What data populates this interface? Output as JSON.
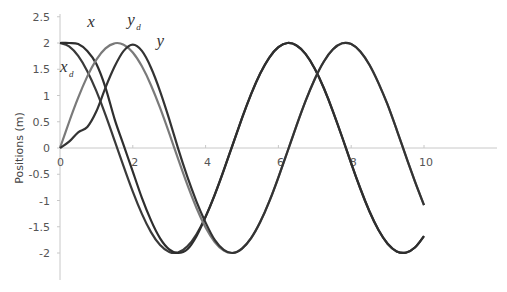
{
  "chart_data": {
    "type": "line",
    "title": "",
    "xlabel": "",
    "ylabel": "Positions (m)",
    "xlim": [
      0,
      12
    ],
    "ylim": [
      -2.5,
      2.5
    ],
    "x_ticks": [
      0,
      2,
      4,
      6,
      8,
      10
    ],
    "y_ticks": [
      2.5,
      2,
      1.5,
      1,
      0.5,
      0,
      -0.5,
      -1,
      -1.5,
      -2
    ],
    "y_tick_labels": [
      "2.5",
      "2",
      "1.5",
      "1",
      "0.5",
      "0",
      "-0.5",
      "-1",
      "-1.5",
      "-2"
    ],
    "x_tick_labels": [
      "0",
      "2",
      "4",
      "6",
      "8",
      "10"
    ],
    "grid": false,
    "legend": "inline labels",
    "x": [
      0,
      0.25,
      0.5,
      0.75,
      1,
      1.25,
      1.5,
      1.75,
      2,
      2.25,
      2.5,
      2.75,
      3,
      3.25,
      3.5,
      3.75,
      4,
      4.25,
      4.5,
      4.75,
      5,
      5.25,
      5.5,
      5.75,
      6,
      6.25,
      6.5,
      6.75,
      7,
      7.25,
      7.5,
      7.75,
      8,
      8.25,
      8.5,
      8.75,
      9,
      9.25,
      9.5,
      9.75,
      10
    ],
    "series": [
      {
        "name": "x_d",
        "label": "x",
        "subscript": "d",
        "color": "#3a3a3a",
        "values": [
          2,
          1.938,
          1.755,
          1.463,
          1.081,
          0.631,
          0.141,
          -0.356,
          -0.832,
          -1.256,
          -1.602,
          -1.849,
          -1.98,
          -1.988,
          -1.873,
          -1.641,
          -1.307,
          -0.892,
          -0.421,
          0.075,
          0.567,
          1.024,
          1.417,
          1.722,
          1.92,
          2.0,
          1.953,
          1.787,
          1.508,
          1.137,
          0.694,
          0.209,
          -0.291,
          -0.772,
          -1.205,
          -1.562,
          -1.822,
          -1.969,
          -1.994,
          -1.896,
          -1.678
        ]
      },
      {
        "name": "x",
        "label": "x",
        "subscript": "",
        "color": "#2e2e2e",
        "values": [
          2,
          2,
          1.98,
          1.85,
          1.6,
          1.15,
          0.55,
          0.05,
          -0.45,
          -0.95,
          -1.38,
          -1.72,
          -1.93,
          -2.0,
          -1.93,
          -1.68,
          -1.31,
          -0.892,
          -0.421,
          0.075,
          0.567,
          1.024,
          1.417,
          1.722,
          1.92,
          2.0,
          1.953,
          1.787,
          1.508,
          1.137,
          0.694,
          0.209,
          -0.291,
          -0.772,
          -1.205,
          -1.562,
          -1.822,
          -1.969,
          -1.994,
          -1.896,
          -1.678
        ]
      },
      {
        "name": "y_d",
        "label": "y",
        "subscript": "d",
        "color": "#7a7a7a",
        "values": [
          0,
          0.495,
          0.959,
          1.363,
          1.683,
          1.898,
          1.995,
          1.968,
          1.819,
          1.556,
          1.197,
          0.763,
          0.282,
          -0.217,
          -0.702,
          -1.143,
          -1.514,
          -1.79,
          -1.955,
          -1.999,
          -1.918,
          -1.718,
          -1.411,
          -1.018,
          -0.559,
          -0.066,
          0.43,
          0.901,
          1.314,
          1.648,
          1.88,
          1.994,
          1.979,
          1.838,
          1.585,
          1.236,
          0.824,
          0.347,
          -0.15,
          -0.636,
          -1.088
        ]
      },
      {
        "name": "y",
        "label": "y",
        "subscript": "",
        "color": "#333333",
        "values": [
          0,
          0.12,
          0.3,
          0.4,
          0.7,
          1.15,
          1.55,
          1.85,
          1.97,
          1.85,
          1.53,
          1.08,
          0.55,
          -0.02,
          -0.55,
          -1.02,
          -1.42,
          -1.75,
          -1.94,
          -2.0,
          -1.918,
          -1.718,
          -1.411,
          -1.018,
          -0.559,
          -0.066,
          0.43,
          0.901,
          1.314,
          1.648,
          1.88,
          1.994,
          1.979,
          1.838,
          1.585,
          1.236,
          0.824,
          0.347,
          -0.15,
          -0.636,
          -1.088
        ]
      }
    ],
    "annotations": [
      {
        "text": "x",
        "near_series": "x",
        "pos": [
          0.75,
          2.3
        ]
      },
      {
        "text": "y_d",
        "near_series": "y_d",
        "pos": [
          1.85,
          2.35
        ]
      },
      {
        "text": "y",
        "near_series": "y",
        "pos": [
          2.65,
          1.95
        ]
      },
      {
        "text": "x_d",
        "near_series": "x_d",
        "pos": [
          0,
          1.45
        ]
      }
    ]
  },
  "layout": {
    "origin_px": [
      60,
      148
    ],
    "px_per_x": 36.4,
    "px_per_y": 52.5,
    "x_axis_end_px": 497,
    "y_axis_top_px": 14,
    "y_axis_bottom_px": 280
  }
}
